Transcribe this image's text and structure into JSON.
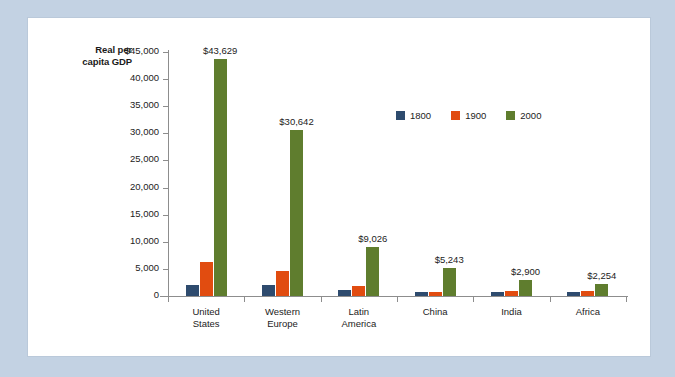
{
  "background_color": "#c3d2e3",
  "card_color": "#ffffff",
  "axis_title": "Real per\ncapita GDP",
  "legend": {
    "items": [
      {
        "label": "1800",
        "color": "#2e4b6e"
      },
      {
        "label": "1900",
        "color": "#e14c10"
      },
      {
        "label": "2000",
        "color": "#5f7d2e"
      }
    ]
  },
  "y_axis": {
    "ticks": [
      {
        "value": 45000,
        "label": "$45,000"
      },
      {
        "value": 40000,
        "label": "40,000"
      },
      {
        "value": 35000,
        "label": "35,000"
      },
      {
        "value": 30000,
        "label": "30,000"
      },
      {
        "value": 25000,
        "label": "25,000"
      },
      {
        "value": 20000,
        "label": "20,000"
      },
      {
        "value": 15000,
        "label": "15,000"
      },
      {
        "value": 10000,
        "label": "10,000"
      },
      {
        "value": 5000,
        "label": "5,000"
      },
      {
        "value": 0,
        "label": "0"
      }
    ]
  },
  "chart_data": {
    "type": "bar",
    "title": "",
    "xlabel": "",
    "ylabel": "Real per capita GDP",
    "ylim": [
      0,
      45000
    ],
    "grid": false,
    "legend_position": "inside-upper-right",
    "categories": [
      "United\nStates",
      "Western\nEurope",
      "Latin\nAmerica",
      "China",
      "India",
      "Africa"
    ],
    "series": [
      {
        "name": "1800",
        "color": "#2e4b6e",
        "values": [
          2000,
          2000,
          1100,
          800,
          800,
          700
        ]
      },
      {
        "name": "1900",
        "color": "#e14c10",
        "values": [
          6200,
          4700,
          1800,
          750,
          850,
          900
        ]
      },
      {
        "name": "2000",
        "color": "#5f7d2e",
        "values": [
          43629,
          30642,
          9026,
          5243,
          2900,
          2254
        ]
      }
    ],
    "value_labels": {
      "series": "2000",
      "labels": [
        "$43,629",
        "$30,642",
        "$9,026",
        "$5,243",
        "$2,900",
        "$2,254"
      ]
    }
  }
}
